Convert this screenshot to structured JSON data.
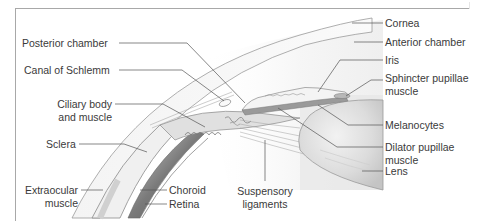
{
  "figure": {
    "colors": {
      "line": "#555555",
      "tissue_light": "#ececec",
      "tissue_mid": "#d0d0d0",
      "tissue_dark": "#6a6a6a",
      "frame": "#a8a8a8",
      "text": "#3a3a3a"
    },
    "labels_left": [
      {
        "id": "posterior-chamber",
        "text": "Posterior chamber"
      },
      {
        "id": "canal-of-schlemm",
        "text": "Canal of Schlemm"
      },
      {
        "id": "ciliary-body",
        "line1": "Ciliary body",
        "line2": "and muscle"
      },
      {
        "id": "sclera",
        "text": "Sclera"
      },
      {
        "id": "extraocular-muscle",
        "line1": "Extraocular",
        "line2": "muscle"
      }
    ],
    "labels_bottom": [
      {
        "id": "choroid",
        "text": "Choroid"
      },
      {
        "id": "retina",
        "text": "Retina"
      },
      {
        "id": "suspensory-ligaments",
        "line1": "Suspensory",
        "line2": "ligaments"
      }
    ],
    "labels_right": [
      {
        "id": "cornea",
        "text": "Cornea"
      },
      {
        "id": "anterior-chamber",
        "text": "Anterior chamber"
      },
      {
        "id": "iris",
        "text": "Iris"
      },
      {
        "id": "sphincter-pupillae-muscle",
        "line1": "Sphincter pupillae",
        "line2": "muscle"
      },
      {
        "id": "melanocytes",
        "text": "Melanocytes"
      },
      {
        "id": "dilator-pupillae-muscle",
        "line1": "Dilator pupillae",
        "line2": "muscle"
      },
      {
        "id": "lens",
        "text": "Lens"
      }
    ]
  }
}
